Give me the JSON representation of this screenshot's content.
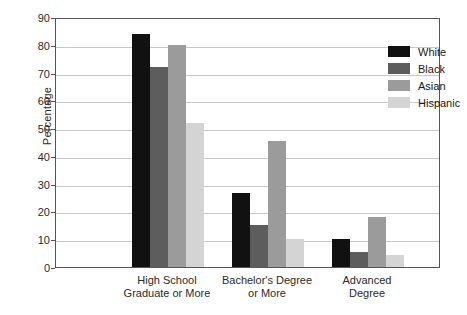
{
  "chart_data": {
    "type": "bar",
    "title": "",
    "xlabel": "",
    "ylabel": "Percentage",
    "ylim": [
      0,
      90
    ],
    "ytick_step": 10,
    "yticks": [
      0,
      10,
      20,
      30,
      40,
      50,
      60,
      70,
      80,
      90
    ],
    "ytick_labels": [
      "0",
      "10",
      "20",
      "30",
      "40",
      "50",
      "60",
      "70",
      "80",
      "90"
    ],
    "grid": "horizontal",
    "legend_position": "top-right-inside",
    "categories": [
      "High School\nGraduate or More",
      "Bachelor's Degree\nor More",
      "Advanced\nDegree"
    ],
    "series": [
      {
        "name": "White",
        "color": "#111111",
        "values": [
          84,
          26.5,
          10
        ]
      },
      {
        "name": "Black",
        "color": "#5d5d5d",
        "values": [
          72,
          15,
          5.5
        ]
      },
      {
        "name": "Asian",
        "color": "#9b9b9b",
        "values": [
          80,
          45.5,
          18
        ]
      },
      {
        "name": "Hispanic",
        "color": "#d4d4d4",
        "values": [
          52,
          10,
          4.5
        ]
      }
    ]
  },
  "axis": {
    "y_title": "Percentage"
  },
  "legend": {
    "entries": [
      {
        "label": "White"
      },
      {
        "label": "Black"
      },
      {
        "label": "Asian"
      },
      {
        "label": "Hispanic"
      }
    ]
  }
}
